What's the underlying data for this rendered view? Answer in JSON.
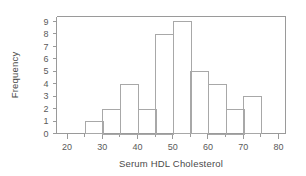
{
  "chart_data": {
    "type": "bar",
    "title": "",
    "subtitle": "",
    "xlabel": "Serum HDL Cholesterol",
    "ylabel": "Frequency",
    "xlim": [
      17,
      82
    ],
    "ylim": [
      0,
      9.4
    ],
    "grid": false,
    "legend": null,
    "bin_width": 5,
    "bin_edges": [
      25,
      30,
      35,
      40,
      45,
      50,
      55,
      60,
      65,
      70,
      75
    ],
    "categories": [
      "25-30",
      "30-35",
      "35-40",
      "40-45",
      "45-50",
      "50-55",
      "55-60",
      "60-65",
      "65-70",
      "70-75"
    ],
    "values": [
      1,
      2,
      4,
      2,
      8,
      9,
      5,
      4,
      2,
      3
    ],
    "x_major_ticks": [
      20,
      30,
      40,
      50,
      60,
      70,
      80
    ],
    "x_major_tick_labels": [
      "20",
      "30",
      "40",
      "50",
      "60",
      "70",
      "80"
    ],
    "x_minor_ticks": [
      25,
      35,
      45,
      55,
      65,
      75
    ],
    "y_ticks": [
      0,
      1,
      2,
      3,
      4,
      5,
      6,
      7,
      8,
      9
    ],
    "y_tick_labels": [
      "0",
      "1",
      "2",
      "3",
      "4",
      "5",
      "6",
      "7",
      "8",
      "9"
    ],
    "colors": {
      "background": "#ffffff",
      "bar_fill": "none",
      "bar_stroke": "#a8a8a8",
      "axis": "#9a9a9a",
      "text": "#5a5a5a"
    }
  }
}
